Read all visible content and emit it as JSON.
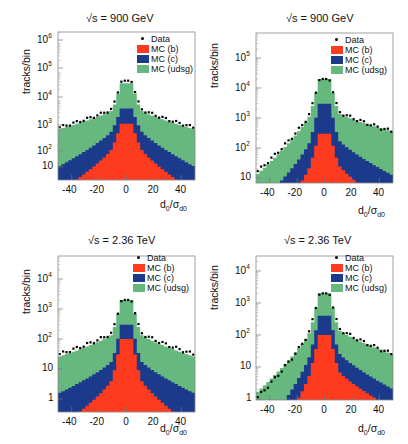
{
  "colors": {
    "b": "#ff3b1f",
    "c": "#1c3a8c",
    "udsg": "#66b87e",
    "data": "#000000",
    "frame": "#888888"
  },
  "legend": {
    "data": "Data",
    "b": "MC (b)",
    "c": "MC (c)",
    "udsg": "MC (udsg)"
  },
  "axis": {
    "ylabel": "tracks/bin",
    "xlabel_main": "d",
    "xlabel_sub0": "0",
    "xlabel_slash": "/σ",
    "xlabel_sub": "d0"
  },
  "chart_data": [
    {
      "type": "bar",
      "title": "√s = 900 GeV",
      "xlabel": "d0/σd0",
      "ylabel": "tracks/bin",
      "xlim": [
        -50,
        50
      ],
      "ylog": true,
      "ylim": [
        3,
        1500000
      ],
      "xticks": [
        -40,
        -20,
        0,
        20,
        40
      ],
      "yticks": [
        "10",
        "10^2",
        "10^3",
        "10^4",
        "10^5",
        "10^6"
      ],
      "profile": {
        "udsg": {
          "peak": 600000,
          "center": 20000,
          "edge": 300,
          "side": 1800
        },
        "c": {
          "peak": 20000,
          "center": 2000,
          "edge": 10,
          "side": 300
        },
        "b": {
          "peak": 1400,
          "center": 500,
          "edge": 1,
          "side": 60
        },
        "data_peak": 550000,
        "data_near": 25000,
        "data_edge": 350,
        "asym": 1.0
      }
    },
    {
      "type": "bar",
      "title": "√s = 900 GeV",
      "xlabel": "d0/σd0",
      "ylabel": "tracks/bin",
      "xlim": [
        -50,
        50
      ],
      "ylog": true,
      "ylim": [
        6,
        500000
      ],
      "xticks": [
        -40,
        -20,
        0,
        20,
        40
      ],
      "yticks": [
        "10",
        "10^2",
        "10^3",
        "10^4",
        "10^5"
      ],
      "profile": {
        "udsg": {
          "peak": 300000,
          "center": 20000,
          "edge": 12,
          "side": 1500,
          "edge_pos": 350
        },
        "c": {
          "peak": 20000,
          "center": 3000,
          "edge": 1,
          "side": 200,
          "edge_pos": 12
        },
        "b": {
          "peak": 800,
          "center": 300,
          "edge": 0.1,
          "side": 30,
          "edge_pos": 1
        },
        "data_peak": 300000,
        "data_near": 20000,
        "data_edge": 15,
        "data_edge_pos": 350,
        "asym": 1.0
      }
    },
    {
      "type": "bar",
      "title": "√s = 2.36 TeV",
      "xlabel": "d0/σd0",
      "ylabel": "tracks/bin",
      "xlim": [
        -50,
        50
      ],
      "ylog": true,
      "ylim": [
        1,
        60000
      ],
      "xticks": [
        -40,
        -20,
        0,
        20,
        40
      ],
      "yticks": [
        "1",
        "10",
        "10^2",
        "10^3",
        "10^4"
      ],
      "profile": {
        "udsg": {
          "peak": 40000,
          "center": 2000,
          "edge": 25,
          "side": 150
        },
        "c": {
          "peak": 2500,
          "center": 300,
          "edge": 1.5,
          "side": 20
        },
        "b": {
          "peak": 300,
          "center": 100,
          "edge": 0.1,
          "side": 5
        },
        "data_peak": 35000,
        "data_near": 2000,
        "data_edge": 30,
        "asym": 1.0
      }
    },
    {
      "type": "bar",
      "title": "√s = 2.36 TeV",
      "xlabel": "d0/σd0",
      "ylabel": "tracks/bin",
      "xlim": [
        -50,
        50
      ],
      "ylog": true,
      "ylim": [
        0.3,
        50000
      ],
      "xticks": [
        -40,
        -20,
        0,
        20,
        40
      ],
      "yticks": [
        "1",
        "10",
        "10^2",
        "10^3",
        "10^4"
      ],
      "profile": {
        "udsg": {
          "peak": 20000,
          "center": 2000,
          "edge": 1.5,
          "side": 150,
          "edge_pos": 25
        },
        "c": {
          "peak": 2000,
          "center": 400,
          "edge": 0.05,
          "side": 30,
          "edge_pos": 2
        },
        "b": {
          "peak": 200,
          "center": 100,
          "edge": 0.01,
          "side": 8,
          "edge_pos": 0.5
        },
        "data_peak": 25000,
        "data_near": 2000,
        "data_edge": 1,
        "data_edge_pos": 25,
        "asym": 1.0
      }
    }
  ]
}
